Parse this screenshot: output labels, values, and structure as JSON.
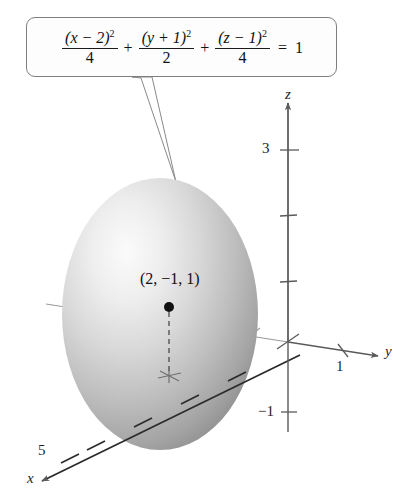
{
  "figure": {
    "type": "3d-ellipsoid-plot",
    "callout": {
      "equation_plain": "(x - 2)^2/4 + (y + 1)^2/2 + (z - 1)^2/4 = 1",
      "terms": [
        {
          "numerator_base": "(x − 2)",
          "numerator_exp": "2",
          "denominator": "4"
        },
        {
          "numerator_base": "(y + 1)",
          "numerator_exp": "2",
          "denominator": "2"
        },
        {
          "numerator_base": "(z − 1)",
          "numerator_exp": "2",
          "denominator": "4"
        }
      ],
      "operators": [
        "+",
        "+"
      ],
      "equals": "=",
      "right_side": "1"
    },
    "axes": [
      {
        "name": "z",
        "label": "z",
        "direction": "up"
      },
      {
        "name": "y",
        "label": "y",
        "direction": "right-down"
      },
      {
        "name": "x",
        "label": "x",
        "direction": "left-down"
      }
    ],
    "tick_labels": [
      {
        "axis": "z",
        "value": "3"
      },
      {
        "axis": "z",
        "value": "−1"
      },
      {
        "axis": "y",
        "value": "1"
      },
      {
        "axis": "x",
        "value": "5"
      }
    ],
    "center_point": {
      "label": "(2, −1, 1)",
      "x": "2",
      "y": "−1",
      "z": "1"
    },
    "colors": {
      "surface_light": "#f2f2f2",
      "surface_mid": "#b9b9b9",
      "surface_dark": "#8f8f8f",
      "axis": "#5a5a5a",
      "outline": "#7e7e7e",
      "text": "#1a1a1a",
      "background": "#ffffff"
    }
  }
}
